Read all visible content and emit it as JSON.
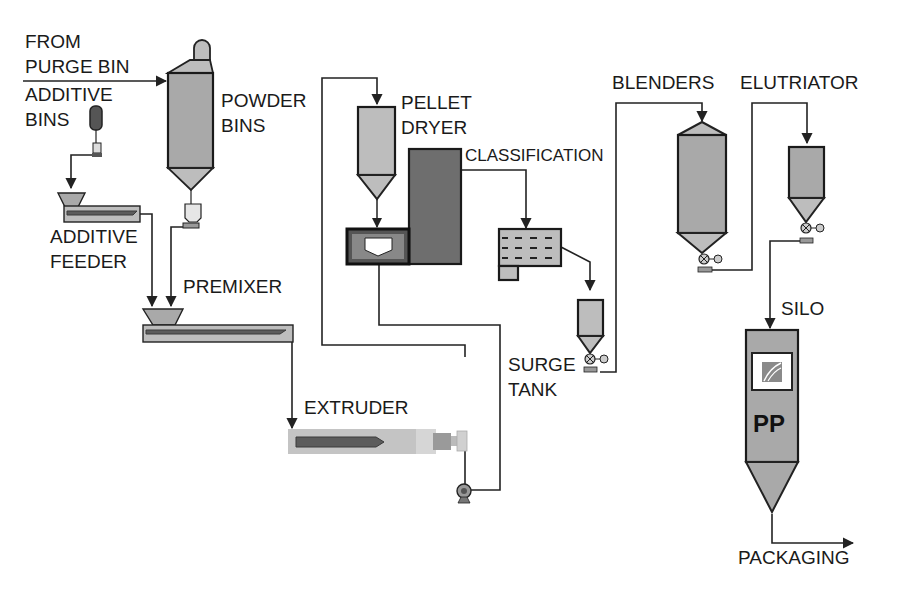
{
  "diagram": {
    "labels": {
      "from_purge_bin_1": "FROM",
      "from_purge_bin_2": "PURGE BIN",
      "additive_bins_1": "ADDITIVE",
      "additive_bins_2": "BINS",
      "powder_bins_1": "POWDER",
      "powder_bins_2": "BINS",
      "additive_feeder_1": "ADDITIVE",
      "additive_feeder_2": "FEEDER",
      "premixer": "PREMIXER",
      "extruder": "EXTRUDER",
      "pellet_dryer_1": "PELLET",
      "pellet_dryer_2": "DRYER",
      "classification": "CLASSIFICATION",
      "surge_tank_1": "SURGE",
      "surge_tank_2": "TANK",
      "blenders": "BLENDERS",
      "elutriator": "ELUTRIATOR",
      "silo": "SILO",
      "silo_product": "PP",
      "packaging": "PACKAGING"
    },
    "colors": {
      "light_fill": "#bdbdbd",
      "medium_fill": "#a9a9a9",
      "dark_fill": "#6e6e6e",
      "line": "#222222"
    },
    "flow": [
      "FROM PURGE BIN -> POWDER BINS",
      "ADDITIVE BINS -> ADDITIVE FEEDER",
      "ADDITIVE FEEDER -> PREMIXER",
      "POWDER BINS -> PREMIXER",
      "PREMIXER -> EXTRUDER",
      "EXTRUDER -> PELLET DRYER",
      "PELLET DRYER -> CLASSIFICATION",
      "CLASSIFICATION -> SURGE TANK",
      "SURGE TANK -> BLENDERS",
      "BLENDERS -> ELUTRIATOR",
      "ELUTRIATOR -> SILO",
      "SILO -> PACKAGING"
    ]
  }
}
